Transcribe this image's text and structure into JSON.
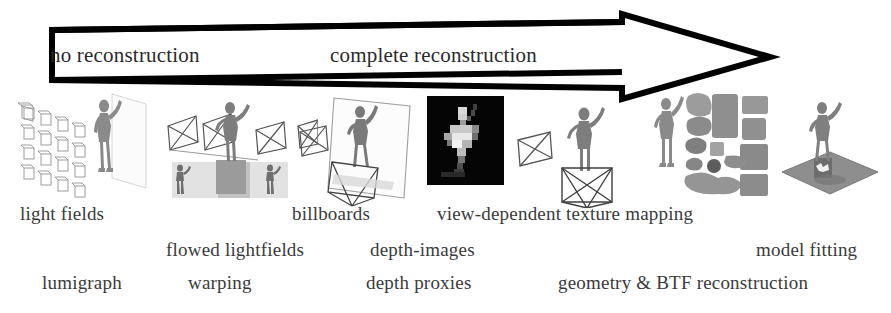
{
  "figure": {
    "background_color": "#ffffff",
    "ink_color": "#000000"
  },
  "arrow": {
    "name": "reconstruction-spectrum-arrow",
    "direction": "left-to-right",
    "left_label": "no reconstruction",
    "right_label": "complete reconstruction",
    "outline_color": "#000000",
    "fill_color": "#ffffff"
  },
  "captions": {
    "row1": [
      {
        "text": "light fields",
        "x": 20,
        "y": 203
      },
      {
        "text": "billboards",
        "x": 292,
        "y": 203
      },
      {
        "text": "view-dependent texture mapping",
        "x": 437,
        "y": 203
      }
    ],
    "row2": [
      {
        "text": "flowed lightfields",
        "x": 166,
        "y": 239
      },
      {
        "text": "depth-images",
        "x": 370,
        "y": 239
      },
      {
        "text": "model fitting",
        "x": 756,
        "y": 239
      }
    ],
    "row3": [
      {
        "text": "lumigraph",
        "x": 42,
        "y": 272
      },
      {
        "text": "warping",
        "x": 188,
        "y": 272
      },
      {
        "text": "depth proxies",
        "x": 366,
        "y": 272
      },
      {
        "text": "geometry & BTF reconstruction",
        "x": 558,
        "y": 272
      }
    ]
  },
  "illustrations": [
    {
      "name": "light-field-camera-array",
      "caption_ref": "light fields"
    },
    {
      "name": "flowed-lightfield-cameras",
      "caption_ref": "flowed lightfields"
    },
    {
      "name": "billboard-plane",
      "caption_ref": "billboards"
    },
    {
      "name": "depth-image-map",
      "caption_ref": "depth-images"
    },
    {
      "name": "depth-proxy-frustums",
      "caption_ref": "depth proxies"
    },
    {
      "name": "btf-texture-atlas",
      "caption_ref": "geometry & BTF reconstruction"
    },
    {
      "name": "fitted-model-on-ground-plane",
      "caption_ref": "model fitting"
    }
  ]
}
